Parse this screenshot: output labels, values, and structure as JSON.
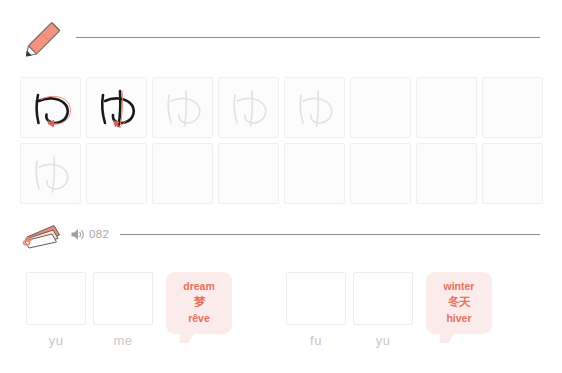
{
  "writing": {
    "icon": "pencil-icon",
    "character": "ゆ",
    "romaji": "yu",
    "rows": [
      {
        "cells": [
          {
            "state": "stroke-demo",
            "stroke_index": 1,
            "has_arrow": true
          },
          {
            "state": "stroke-demo",
            "stroke_index": 2,
            "has_arrow": true
          },
          {
            "state": "trace-guide"
          },
          {
            "state": "trace-guide"
          },
          {
            "state": "trace-guide"
          },
          {
            "state": "empty"
          },
          {
            "state": "empty"
          },
          {
            "state": "empty"
          }
        ]
      },
      {
        "cells": [
          {
            "state": "trace-guide"
          },
          {
            "state": "empty"
          },
          {
            "state": "empty"
          },
          {
            "state": "empty"
          },
          {
            "state": "empty"
          },
          {
            "state": "empty"
          },
          {
            "state": "empty"
          },
          {
            "state": "empty"
          }
        ]
      }
    ]
  },
  "audio": {
    "deck_icon": "flashcard-deck-icon",
    "speaker_icon": "speaker-icon",
    "track_number": "082"
  },
  "vocab": {
    "groups": [
      {
        "syllables": [
          {
            "label": "yu"
          },
          {
            "label": "me"
          }
        ],
        "bubble": {
          "lines": [
            "dream",
            "梦",
            "rêve"
          ]
        }
      },
      {
        "syllables": [
          {
            "label": "fu"
          },
          {
            "label": "yu"
          }
        ],
        "bubble": {
          "lines": [
            "winter",
            "冬天",
            "hiver"
          ]
        }
      }
    ]
  },
  "colors": {
    "accent": "#ef8a76",
    "arrow": "#e06050",
    "bubble_bg": "#fbeceb",
    "bubble_text": "#e8705c",
    "ink": "#1a1a1a",
    "guide": "#e2e0e0",
    "label": "#c9c7c6",
    "rule": "#8d8d8d"
  }
}
